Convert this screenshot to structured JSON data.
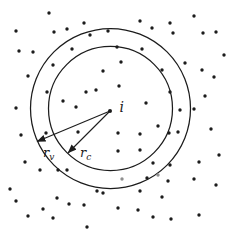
{
  "figure": {
    "name": "interaction-radii-particle-diagram",
    "background": "#ffffff",
    "ink": "#1c1c1c",
    "faint_ink": "#8f8f8f",
    "center": {
      "x": 110.5,
      "y": 108.5,
      "label": "i",
      "dot": {
        "x": 110,
        "y": 111,
        "r": 2
      },
      "label_pos": {
        "x": 119.5,
        "y": 112
      }
    },
    "circles": [
      {
        "name": "outer",
        "r": 80
      },
      {
        "name": "inner",
        "r": 62
      }
    ],
    "arrows": [
      {
        "name": "r_v",
        "base": "r",
        "sub": "v",
        "from": {
          "x": 110,
          "y": 111
        },
        "to": {
          "x": 37,
          "y": 141.5
        },
        "label_pos": {
          "x": 43,
          "y": 157
        }
      },
      {
        "name": "r_c",
        "base": "r",
        "sub": "c",
        "from": {
          "x": 110,
          "y": 111
        },
        "to": {
          "x": 68,
          "y": 153
        },
        "label_pos": {
          "x": 80,
          "y": 157
        }
      }
    ],
    "dot_radius": 1.7,
    "points": [
      [
        49,
        13
      ],
      [
        194,
        16
      ],
      [
        140,
        21
      ],
      [
        170,
        23
      ],
      [
        84,
        23
      ],
      [
        152,
        28
      ],
      [
        67,
        29
      ],
      [
        16,
        31
      ],
      [
        54,
        32
      ],
      [
        108,
        31
      ],
      [
        216,
        32
      ],
      [
        173,
        33
      ],
      [
        203,
        33
      ],
      [
        90,
        35
      ],
      [
        117,
        47
      ],
      [
        142,
        49
      ],
      [
        19,
        51
      ],
      [
        33,
        52
      ],
      [
        72,
        49
      ],
      [
        224,
        55
      ],
      [
        121,
        62
      ],
      [
        185,
        63
      ],
      [
        53,
        65
      ],
      [
        162,
        70
      ],
      [
        202,
        70
      ],
      [
        103,
        71
      ],
      [
        28,
        76
      ],
      [
        214,
        77
      ],
      [
        119,
        86
      ],
      [
        96,
        90
      ],
      [
        86,
        92
      ],
      [
        47,
        92
      ],
      [
        170,
        92
      ],
      [
        205,
        96
      ],
      [
        63,
        101
      ],
      [
        146,
        103
      ],
      [
        16,
        108
      ],
      [
        76,
        107
      ],
      [
        180,
        110
      ],
      [
        194,
        109
      ],
      [
        158,
        126
      ],
      [
        211,
        129
      ],
      [
        21,
        135
      ],
      [
        46,
        133
      ],
      [
        78,
        132
      ],
      [
        118,
        133
      ],
      [
        140,
        134
      ],
      [
        169,
        133
      ],
      [
        178,
        132
      ],
      [
        140,
        150
      ],
      [
        118,
        151
      ],
      [
        219,
        155
      ],
      [
        25,
        162
      ],
      [
        153,
        163
      ],
      [
        170,
        165
      ],
      [
        199,
        162
      ],
      [
        40,
        170
      ],
      [
        58,
        170
      ],
      [
        67,
        170
      ],
      [
        147,
        178
      ],
      [
        194,
        179
      ],
      [
        168,
        181
      ],
      [
        216,
        185
      ],
      [
        10,
        189
      ],
      [
        97,
        191
      ],
      [
        103,
        193
      ],
      [
        140,
        191
      ],
      [
        162,
        197
      ],
      [
        57,
        198
      ],
      [
        16,
        201
      ],
      [
        69,
        204
      ],
      [
        84,
        205
      ],
      [
        43,
        209
      ],
      [
        138,
        210
      ],
      [
        118,
        208
      ],
      [
        28,
        216
      ],
      [
        53,
        218
      ],
      [
        153,
        217
      ],
      [
        171,
        219
      ],
      [
        199,
        215
      ],
      [
        87,
        227
      ]
    ],
    "faint_points": [
      [
        122,
        179
      ],
      [
        158,
        175
      ]
    ]
  }
}
